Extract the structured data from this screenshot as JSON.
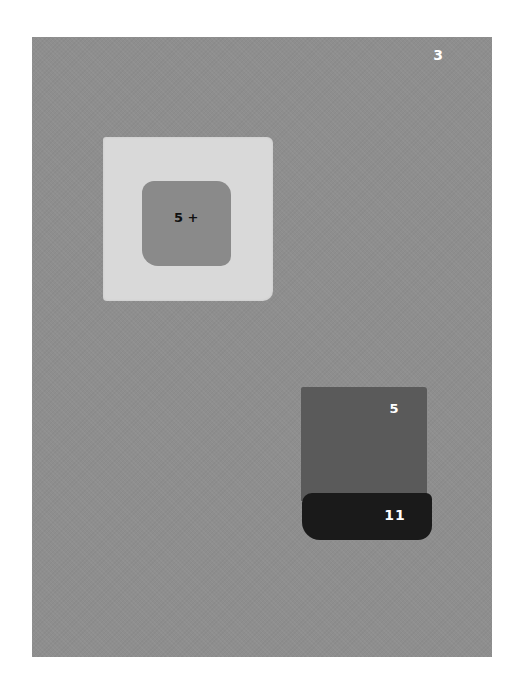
{
  "page_number": "3",
  "swatches": {
    "light_square": {
      "color": "#d9d9d9"
    },
    "inner_square": {
      "color": "#8a8a8a",
      "label": "5 +"
    },
    "dark_square": {
      "color": "#5a5a5a",
      "label": "5"
    },
    "black_strip": {
      "color": "#1a1a1a",
      "label": "11"
    }
  },
  "background": {
    "canvas_color": "#8e8e8e",
    "page_color": "#ffffff"
  }
}
